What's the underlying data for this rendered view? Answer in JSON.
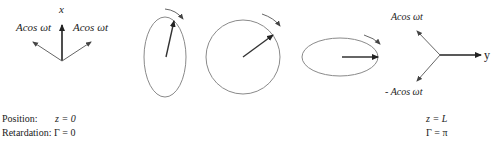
{
  "colors": {
    "stroke": "#333333",
    "ellipse": "#8a8a8a",
    "text": "#222222"
  },
  "start_diagram": {
    "axis_label": "x",
    "left_component": "Acos ωt",
    "right_component": "Acos ωt"
  },
  "ellipses": [
    {
      "name": "vertical-ellipse",
      "shape": "tall ellipse",
      "rotation": "clockwise"
    },
    {
      "name": "circle",
      "shape": "circle",
      "rotation": "clockwise"
    },
    {
      "name": "horizontal-ellipse",
      "shape": "wide ellipse",
      "rotation": "clockwise"
    }
  ],
  "end_diagram": {
    "axis_label": "y",
    "upper_component": "Acos ωt",
    "lower_component": "- Acos ωt"
  },
  "captions": {
    "position_label": "Position:",
    "position_value": "z = 0",
    "retardation_label": "Retardation:",
    "retardation_value": "Γ = 0",
    "end_position_value": "z = L",
    "end_retardation_value": "Γ = π"
  }
}
